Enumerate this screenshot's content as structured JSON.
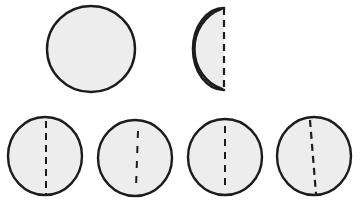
{
  "figure": {
    "background_color": "#ffffff",
    "width": 362,
    "height": 204,
    "fill_color": "#ededed",
    "outline_color": "#1c1c1c",
    "dash_color": "#1c1c1c"
  },
  "shapes": {
    "top_circle": {
      "label": "plain circle",
      "cx": 91,
      "cy": 49,
      "rx": 44,
      "ry": 43,
      "outline_width": 2.4,
      "has_dash": false
    },
    "half_disc": {
      "label": "folded half disc",
      "fold_line_x": 224,
      "fold_top_y": 8,
      "fold_bottom_y": 90,
      "inner_arc_left_x": 193,
      "outer_arc_left_x": 185,
      "cy": 49,
      "outline_width": 2.6,
      "dash_pattern": "7 5",
      "dash_width": 2.2,
      "has_dash": true
    },
    "bottom_circles": [
      {
        "label": "circle with centered fold line",
        "cx": 45,
        "cy": 156,
        "rx": 37,
        "ry": 39,
        "outline_width": 2.4,
        "dash_x_top": 46,
        "dash_x_bottom": 46,
        "dash_top_y": 121,
        "dash_bottom_y": 194,
        "dash_pattern": "7 5",
        "dash_width": 2.0
      },
      {
        "label": "circle with short fold line right of center",
        "cx": 135,
        "cy": 158,
        "rx": 37,
        "ry": 38,
        "outline_width": 2.4,
        "dash_x_top": 138,
        "dash_x_bottom": 136,
        "dash_top_y": 131,
        "dash_bottom_y": 187,
        "dash_pattern": "7 8",
        "dash_width": 2.0
      },
      {
        "label": "circle with long fold line left of center",
        "cx": 225,
        "cy": 157,
        "rx": 37,
        "ry": 38,
        "outline_width": 2.4,
        "dash_x_top": 225,
        "dash_x_bottom": 225,
        "dash_top_y": 126,
        "dash_bottom_y": 190,
        "dash_pattern": "7 6",
        "dash_width": 2.0
      },
      {
        "label": "circle with slanted fold line",
        "cx": 314,
        "cy": 156,
        "rx": 37,
        "ry": 39,
        "outline_width": 2.4,
        "dash_x_top": 310,
        "dash_x_bottom": 316,
        "dash_top_y": 120,
        "dash_bottom_y": 194,
        "dash_pattern": "7 5",
        "dash_width": 2.2
      }
    ]
  }
}
